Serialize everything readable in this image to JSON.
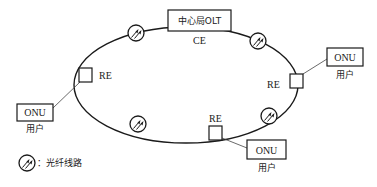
{
  "diagram": {
    "center_node": {
      "label": "中心局OLT",
      "sublabel": "CE"
    },
    "remote_nodes": [
      {
        "id": "re-left",
        "label": "RE"
      },
      {
        "id": "re-right",
        "label": "RE"
      },
      {
        "id": "re-bottom",
        "label": "RE"
      }
    ],
    "onus": [
      {
        "id": "onu-left",
        "label": "ONU",
        "sublabel": "用户"
      },
      {
        "id": "onu-right",
        "label": "ONU",
        "sublabel": "用户"
      },
      {
        "id": "onu-bottom",
        "label": "ONU",
        "sublabel": "用户"
      }
    ],
    "fiber_markers": 4,
    "legend": {
      "label": "：光纤线路"
    },
    "colors": {
      "stroke": "#1a1a1a",
      "background": "#ffffff"
    }
  }
}
